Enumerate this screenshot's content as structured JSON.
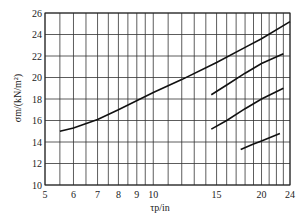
{
  "chart_data": {
    "type": "line",
    "title": "",
    "xlabel": "τp/in",
    "ylabel": "σm/(kN/m²)",
    "xscale": "log",
    "xlim": [
      5,
      24
    ],
    "ylim": [
      10,
      26
    ],
    "grid": true,
    "x_ticks": [
      5,
      6,
      7,
      8,
      9,
      10,
      15,
      20,
      24
    ],
    "x_minor_gridlines": [
      5.5,
      6.5,
      7.5,
      8.5,
      9.5,
      11,
      12,
      13,
      14,
      16,
      17,
      18,
      19,
      21,
      22,
      23
    ],
    "y_ticks": [
      10,
      12,
      14,
      16,
      18,
      20,
      22,
      24,
      26
    ],
    "series": [
      {
        "name": "curve-1",
        "points": [
          [
            5.5,
            15.0
          ],
          [
            6.0,
            15.3
          ],
          [
            7.0,
            16.1
          ],
          [
            8.0,
            17.0
          ],
          [
            10.0,
            18.6
          ],
          [
            12.0,
            19.8
          ],
          [
            15.0,
            21.4
          ],
          [
            18.0,
            22.8
          ],
          [
            20.0,
            23.6
          ],
          [
            24.0,
            25.2
          ]
        ]
      },
      {
        "name": "curve-2",
        "points": [
          [
            14.5,
            18.4
          ],
          [
            16.0,
            19.3
          ],
          [
            18.0,
            20.4
          ],
          [
            20.0,
            21.3
          ],
          [
            23.0,
            22.2
          ]
        ]
      },
      {
        "name": "curve-3",
        "points": [
          [
            14.5,
            15.2
          ],
          [
            16.0,
            16.0
          ],
          [
            18.0,
            17.1
          ],
          [
            20.0,
            18.0
          ],
          [
            23.0,
            19.0
          ]
        ]
      },
      {
        "name": "curve-4",
        "points": [
          [
            17.5,
            13.3
          ],
          [
            19.0,
            13.8
          ],
          [
            20.0,
            14.1
          ],
          [
            22.5,
            14.8
          ]
        ]
      }
    ]
  }
}
